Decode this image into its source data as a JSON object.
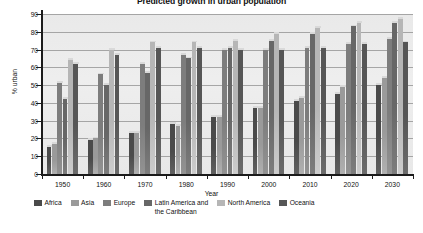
{
  "chart_data": {
    "type": "bar",
    "title": "Predicted growth in urban population",
    "xlabel": "Year",
    "ylabel": "% urban",
    "ylim": [
      0,
      90
    ],
    "ytick_step": 10,
    "yticks": [
      0,
      10,
      20,
      30,
      40,
      50,
      60,
      70,
      80,
      90
    ],
    "grid": true,
    "legend_position": "bottom",
    "categories": [
      "1950",
      "1960",
      "1970",
      "1980",
      "1990",
      "2000",
      "2010",
      "2020",
      "2030"
    ],
    "series": [
      {
        "name": "Africa",
        "color": "#4a4a4a",
        "values": [
          15,
          19,
          23,
          28,
          32,
          37,
          41,
          45,
          50
        ]
      },
      {
        "name": "Asia",
        "color": "#9a9a9a",
        "values": [
          17,
          20,
          23,
          27,
          32,
          37,
          43,
          49,
          54
        ]
      },
      {
        "name": "Europe",
        "color": "#7d7d7d",
        "values": [
          51,
          56,
          62,
          67,
          70,
          70,
          71,
          73,
          76
        ]
      },
      {
        "name": "Latin America and\nthe Caribbean",
        "color": "#676767",
        "values": [
          42,
          50,
          57,
          65,
          71,
          75,
          79,
          83,
          85
        ]
      },
      {
        "name": "North America",
        "color": "#b6b6b6",
        "values": [
          64,
          70,
          74,
          74,
          75,
          79,
          82,
          85,
          87
        ]
      },
      {
        "name": "Oceania",
        "color": "#565656",
        "values": [
          62,
          67,
          71,
          71,
          70,
          70,
          71,
          73,
          74
        ]
      }
    ]
  }
}
